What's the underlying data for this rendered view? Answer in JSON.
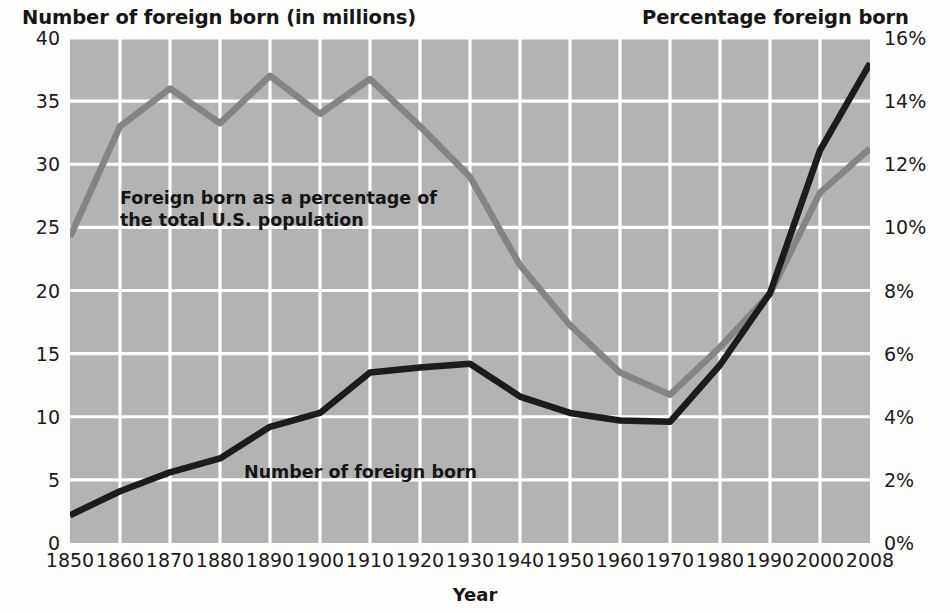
{
  "titles": {
    "left": "Number of foreign born (in millions)",
    "right": "Percentage foreign born"
  },
  "axis": {
    "x_title": "Year"
  },
  "annotations": {
    "percentage": "Foreign born as a percentage of\nthe total U.S. population",
    "number": "Number of foreign born"
  },
  "colors": {
    "plot_background": "#b3b3b3",
    "gridline": "#ffffff",
    "number_line": "#1c1c1c",
    "percentage_line": "#848484",
    "page_background": "#fdfdfb",
    "text": "#1b1b1b"
  },
  "chart_data": {
    "type": "line",
    "xlabel": "Year",
    "grid": true,
    "legend": "inline-annotations",
    "x": [
      1850,
      1860,
      1870,
      1880,
      1890,
      1900,
      1910,
      1920,
      1930,
      1940,
      1950,
      1960,
      1970,
      1980,
      1990,
      2000,
      2008
    ],
    "xticklabels": [
      "1850",
      "1860",
      "1870",
      "1880",
      "1890",
      "1900",
      "1910",
      "1920",
      "1930",
      "1940",
      "1950",
      "1960",
      "1970",
      "1980",
      "1990",
      "2000",
      "2008"
    ],
    "axes": [
      {
        "side": "left",
        "label": "Number of foreign born (in millions)",
        "lim": [
          0,
          40
        ],
        "ticks": [
          0,
          5,
          10,
          15,
          20,
          25,
          30,
          35,
          40
        ],
        "ticklabels": [
          "0",
          "5",
          "10",
          "15",
          "20",
          "25",
          "30",
          "35",
          "40"
        ]
      },
      {
        "side": "right",
        "label": "Percentage foreign born",
        "lim": [
          0,
          16
        ],
        "ticks": [
          0,
          2,
          4,
          6,
          8,
          10,
          12,
          14,
          16
        ],
        "ticklabels": [
          "0%",
          "2%",
          "4%",
          "6%",
          "8%",
          "10%",
          "12%",
          "14%",
          "16%"
        ]
      }
    ],
    "series": [
      {
        "name": "Number of foreign born",
        "axis": "left",
        "unit": "millions",
        "color": "#1c1c1c",
        "values": [
          2.2,
          4.1,
          5.6,
          6.7,
          9.2,
          10.3,
          13.5,
          13.9,
          14.2,
          11.6,
          10.3,
          9.7,
          9.6,
          14.1,
          19.8,
          31.1,
          38.0
        ]
      },
      {
        "name": "Foreign born as a percentage of the total U.S. population",
        "axis": "right",
        "unit": "percent",
        "color": "#848484",
        "values": [
          9.7,
          13.2,
          14.4,
          13.3,
          14.8,
          13.6,
          14.7,
          13.2,
          11.6,
          8.8,
          6.9,
          5.4,
          4.7,
          6.2,
          7.9,
          11.1,
          12.5
        ]
      }
    ]
  }
}
